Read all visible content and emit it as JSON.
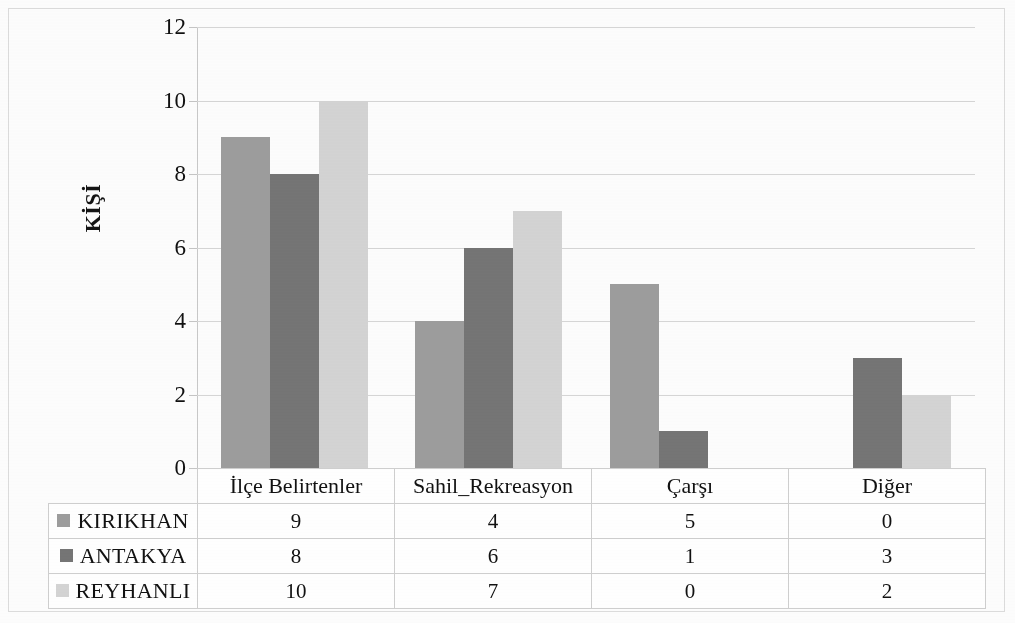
{
  "chart_data": {
    "type": "bar",
    "title": "",
    "subtitle": "",
    "xlabel": "",
    "ylabel": "KİŞİ",
    "ylim": [
      0,
      12
    ],
    "yticks": [
      0,
      2,
      4,
      6,
      8,
      10,
      12
    ],
    "grid": true,
    "legend_position": "data-table-below",
    "categories": [
      "İlçe Belirtenler",
      "Sahil_Rekreasyon",
      "Çarşı",
      "Diğer"
    ],
    "series": [
      {
        "name": "KIRIKHAN",
        "values": [
          9,
          4,
          5,
          0
        ],
        "color": "#9d9d9d"
      },
      {
        "name": "ANTAKYA",
        "values": [
          8,
          6,
          1,
          3
        ],
        "color": "#757575"
      },
      {
        "name": "REYHANLI",
        "values": [
          10,
          7,
          0,
          2
        ],
        "color": "#d4d4d4"
      }
    ]
  },
  "table": {
    "header_corner": ""
  }
}
